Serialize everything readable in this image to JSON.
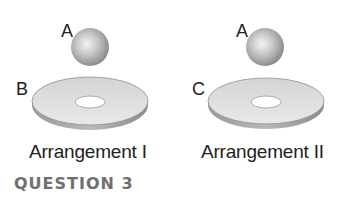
{
  "figure": {
    "arrangements": [
      {
        "sphere_label": "A",
        "disk_label": "B",
        "caption": "Arrangement I"
      },
      {
        "sphere_label": "A",
        "disk_label": "C",
        "caption": "Arrangement II"
      }
    ],
    "question_label": "QUESTION 3"
  }
}
